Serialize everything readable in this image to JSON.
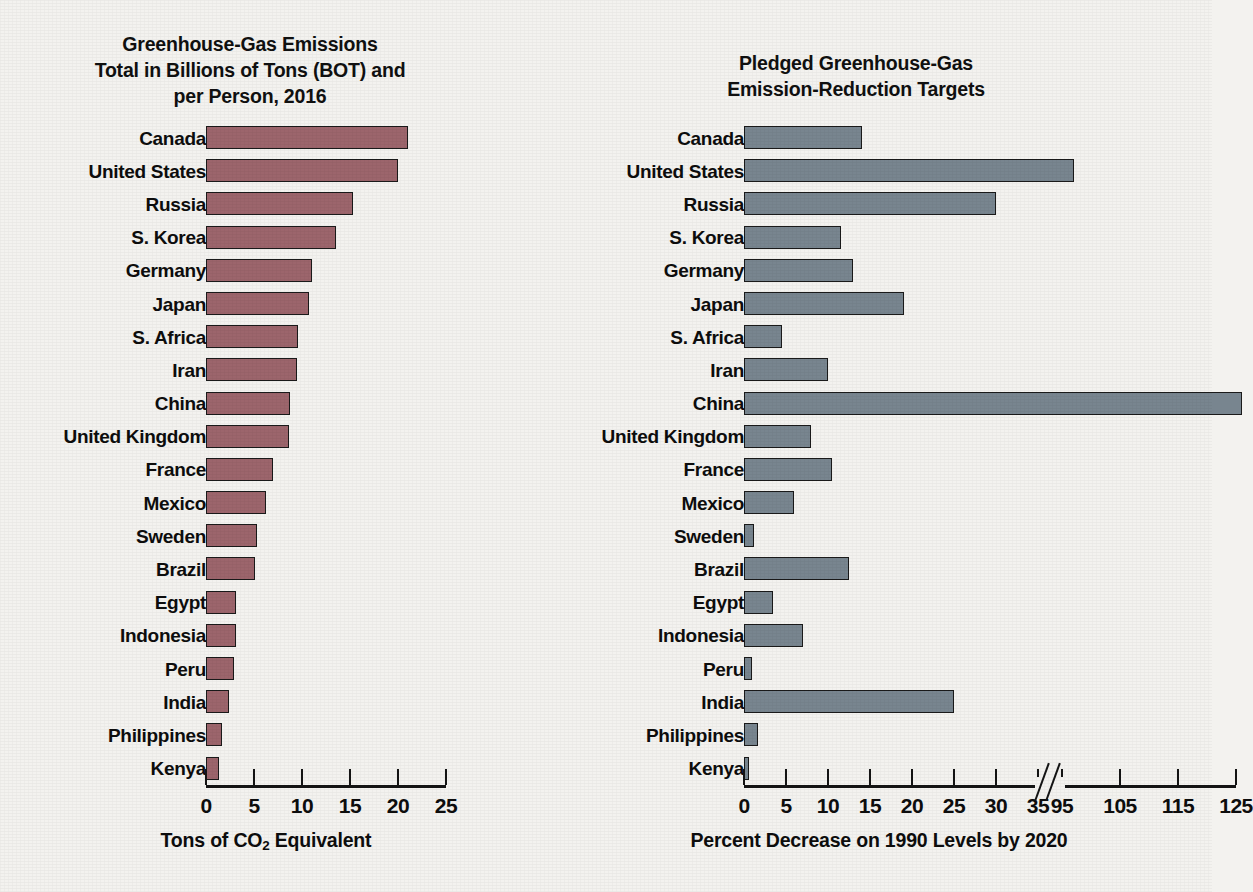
{
  "figure": {
    "background": "#f3f2ef",
    "panels": [
      "emissions",
      "pledges"
    ]
  },
  "chart_data": [
    {
      "id": "emissions",
      "type": "bar",
      "orientation": "horizontal",
      "title": "Greenhouse-Gas Emissions\nTotal in Billions of Tons (BOT) and\nper Person, 2016",
      "title_lines": [
        "Greenhouse-Gas Emissions",
        "Total in Billions of Tons (BOT) and",
        "per Person, 2016"
      ],
      "xlabel": "Tons of CO2 Equivalent",
      "xlabel_parts": {
        "pre": "Tons of CO",
        "sub": "2",
        "post": " Equivalent"
      },
      "ylabel": "",
      "xlim": [
        0,
        25
      ],
      "xticks": [
        0,
        5,
        10,
        15,
        20,
        25
      ],
      "xtick_labels": [
        "0",
        "5",
        "10",
        "15",
        "20",
        "25"
      ],
      "grid": false,
      "legend": "none",
      "bar_color": "#9c656c",
      "bar_edge_color": "#1a1a1a",
      "categories": [
        "Canada",
        "United States",
        "Russia",
        "S. Korea",
        "Germany",
        "Japan",
        "S. Africa",
        "Iran",
        "China",
        "United Kingdom",
        "France",
        "Mexico",
        "Sweden",
        "Brazil",
        "Egypt",
        "Indonesia",
        "Peru",
        "India",
        "Philippines",
        "Kenya"
      ],
      "values": [
        21.0,
        20.0,
        15.3,
        13.5,
        11.0,
        10.7,
        9.6,
        9.5,
        8.7,
        8.6,
        7.0,
        6.2,
        5.3,
        5.1,
        3.1,
        3.1,
        2.9,
        2.4,
        1.7,
        1.4
      ]
    },
    {
      "id": "pledges",
      "type": "bar",
      "orientation": "horizontal",
      "title": "Pledged Greenhouse-Gas\nEmission-Reduction Targets",
      "title_lines": [
        "Pledged Greenhouse-Gas",
        "Emission-Reduction Targets"
      ],
      "xlabel": "Percent Decrease on 1990 Levels by 2020",
      "ylabel": "",
      "axis_break": {
        "present": true,
        "between": [
          35,
          95
        ],
        "symbol": "double-slash"
      },
      "xticks": [
        0,
        5,
        10,
        15,
        20,
        25,
        30,
        35,
        95,
        105,
        115,
        125
      ],
      "xtick_labels": [
        "0",
        "5",
        "10",
        "15",
        "20",
        "25",
        "30",
        "35",
        "95",
        "105",
        "115",
        "125"
      ],
      "grid": false,
      "legend": "none",
      "bar_color": "#78858f",
      "bar_edge_color": "#1a1a1a",
      "categories": [
        "Canada",
        "United States",
        "Russia",
        "S. Korea",
        "Germany",
        "Japan",
        "S. Africa",
        "Iran",
        "China",
        "United Kingdom",
        "France",
        "Mexico",
        "Sweden",
        "Brazil",
        "Egypt",
        "Indonesia",
        "Peru",
        "India",
        "Philippines",
        "Kenya"
      ],
      "values": [
        14.0,
        97.0,
        30.0,
        11.5,
        13.0,
        19.0,
        4.5,
        10.0,
        126.0,
        8.0,
        10.5,
        6.0,
        1.2,
        12.5,
        3.5,
        7.0,
        1.0,
        25.0,
        1.7,
        0.3
      ]
    }
  ]
}
